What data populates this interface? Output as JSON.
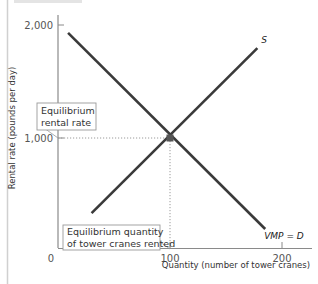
{
  "chart_data": {
    "type": "line",
    "title": "",
    "xlabel": "Quantity (number of tower cranes)",
    "ylabel": "Rental rate (pounds per day)",
    "xlim": [
      0,
      212
    ],
    "ylim": [
      0,
      2050
    ],
    "x_ticks": [
      {
        "value": 0,
        "label": "0"
      },
      {
        "value": 100,
        "label": "100"
      },
      {
        "value": 200,
        "label": "200"
      }
    ],
    "y_ticks": [
      {
        "value": 1000,
        "label": "1,000"
      },
      {
        "value": 2000,
        "label": "2,000"
      }
    ],
    "grid": false,
    "series": [
      {
        "name": "VMP = D",
        "label": "VMP = D",
        "color": "#3a3a3a",
        "points": [
          [
            9,
            1930
          ],
          [
            185,
            195
          ]
        ]
      },
      {
        "name": "S",
        "label": "S",
        "color": "#3a3a3a",
        "points": [
          [
            30,
            335
          ],
          [
            178,
            1795
          ]
        ]
      }
    ],
    "equilibrium": {
      "x": 100,
      "y": 1000,
      "color": "#555555"
    },
    "annotations": [
      {
        "text_lines": [
          "Equilibrium",
          "rental rate"
        ],
        "target": "y-axis 1,000"
      },
      {
        "text_lines": [
          "Equilibrium quantity",
          "of tower cranes rented"
        ],
        "target": "x-axis 100"
      }
    ]
  },
  "colors": {
    "axis": "#8a8a8a",
    "curve": "#3a3a3a",
    "guide": "#9a9a9a",
    "box_border": "#9a9a9a",
    "frame": "#cfcfcf"
  }
}
